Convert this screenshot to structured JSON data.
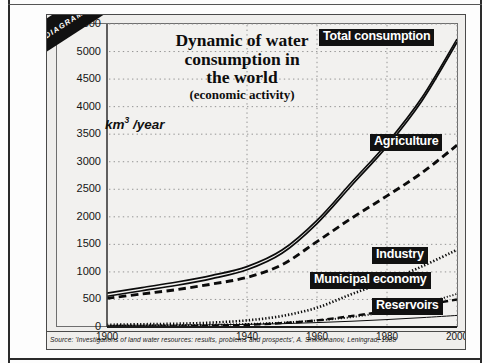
{
  "figure": {
    "ribbon_label": "DIAGRAM 2.11",
    "source": "Source: 'Investigations of land water resources: results, problems and prospects', A. Shiklomanov, Leningrad, 1988",
    "unit_label_prefix": "km",
    "unit_label_exp": "3",
    "unit_label_suffix": "/year"
  },
  "title": {
    "line1": "Dynamic of water",
    "line2": "consumption in",
    "line3": "the world",
    "line4": "(economic activity)"
  },
  "labels": {
    "total": "Total consumption",
    "agriculture": "Agriculture",
    "industry": "Industry",
    "municipal": "Municipal economy",
    "reservoirs": "Reservoirs"
  },
  "chart_data": {
    "type": "line",
    "title": "Dynamic of water consumption in the world (economic activity)",
    "xlabel": "",
    "ylabel": "km3/year",
    "xlim": [
      1900,
      2000
    ],
    "ylim": [
      0,
      5500
    ],
    "ytick_step": 500,
    "yticks": [
      0,
      500,
      1000,
      1500,
      2000,
      2500,
      3000,
      3500,
      4000,
      4500,
      5000,
      5500
    ],
    "xticks": [
      1900,
      1940,
      1960,
      1980,
      2000
    ],
    "xtick_labels": [
      "1900",
      "1940",
      "1960",
      "1980",
      "2000"
    ],
    "grid": true,
    "legend": "inline-labels",
    "x": [
      1900,
      1910,
      1920,
      1930,
      1940,
      1950,
      1960,
      1970,
      1980,
      1990,
      2000
    ],
    "series": [
      {
        "name": "Total consumption",
        "style": "double-solid",
        "values": [
          580,
          680,
          780,
          900,
          1060,
          1360,
          1900,
          2600,
          3300,
          4130,
          5190
        ]
      },
      {
        "name": "Agriculture",
        "style": "dashed-thick",
        "values": [
          520,
          600,
          680,
          780,
          900,
          1130,
          1550,
          1980,
          2380,
          2800,
          3300
        ]
      },
      {
        "name": "Industry",
        "style": "dotted-thick",
        "values": [
          40,
          50,
          60,
          80,
          120,
          200,
          350,
          600,
          830,
          1100,
          1400
        ]
      },
      {
        "name": "Municipal economy",
        "style": "dotted-fine",
        "values": [
          20,
          25,
          30,
          40,
          55,
          80,
          120,
          180,
          280,
          420,
          600
        ]
      },
      {
        "name": "Reservoirs",
        "style": "dashed-long",
        "values": [
          0,
          5,
          10,
          20,
          40,
          70,
          120,
          200,
          290,
          390,
          500
        ]
      },
      {
        "name": "Baseline",
        "style": "thin-solid",
        "values": [
          30,
          32,
          35,
          40,
          48,
          60,
          80,
          105,
          135,
          170,
          210
        ]
      }
    ],
    "annotations": [
      {
        "text": "Total consumption",
        "x": 1975,
        "y": 5400
      },
      {
        "text": "Agriculture",
        "x": 1982,
        "y": 3650
      },
      {
        "text": "Industry",
        "x": 1983,
        "y": 1480
      },
      {
        "text": "Municipal economy",
        "x": 1962,
        "y": 1000
      },
      {
        "text": "Reservoirs",
        "x": 1983,
        "y": 480
      }
    ]
  }
}
